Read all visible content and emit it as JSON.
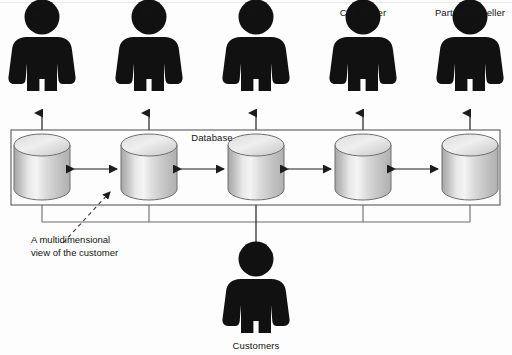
{
  "diagram": {
    "title_label": "Database",
    "annotation": {
      "line1": "A multidimensional",
      "line2": "view of the customer"
    },
    "channels": [
      {
        "label": "Internet",
        "cx": 42
      },
      {
        "label": "Mail",
        "cx": 149
      },
      {
        "label": "Store",
        "cx": 256
      },
      {
        "label": "Call center",
        "cx": 363
      },
      {
        "label": "Partner/Reseller",
        "cx": 470
      }
    ],
    "databases": [
      {
        "name": "db-internet",
        "cx": 42
      },
      {
        "name": "db-mail",
        "cx": 149
      },
      {
        "name": "db-store",
        "cx": 256
      },
      {
        "name": "db-callcenter",
        "cx": 363
      },
      {
        "name": "db-partner",
        "cx": 470
      }
    ],
    "customer": {
      "label": "Customers",
      "cx": 256
    },
    "colors": {
      "figure": "#111111",
      "line": "#2b2b2b",
      "box_border": "#555555",
      "cylinder_light": "#f2f2f2",
      "cylinder_mid": "#c9c9c9",
      "cylinder_dark": "#9a9a9a",
      "cylinder_edge": "#6b6b6b",
      "background": "#fdfdfd"
    }
  }
}
